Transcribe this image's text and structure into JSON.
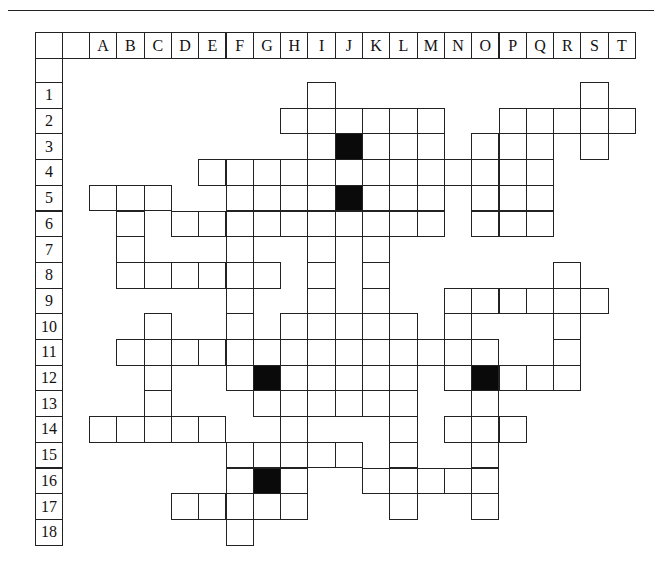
{
  "page": {
    "header_rule": true
  },
  "grid": {
    "columns": [
      "A",
      "B",
      "C",
      "D",
      "E",
      "F",
      "G",
      "H",
      "I",
      "J",
      "K",
      "L",
      "M",
      "N",
      "O",
      "P",
      "Q",
      "R",
      "S",
      "T"
    ],
    "rows": [
      "1",
      "2",
      "3",
      "4",
      "5",
      "6",
      "7",
      "8",
      "9",
      "10",
      "11",
      "12",
      "13",
      "14",
      "15",
      "16",
      "17",
      "18"
    ],
    "white_cells": {
      "1": [
        "I",
        "S"
      ],
      "2": [
        "H",
        "I",
        "J",
        "K",
        "L",
        "M",
        "P",
        "Q",
        "R",
        "S",
        "T"
      ],
      "3": [
        "I",
        "K",
        "L",
        "M",
        "O",
        "P",
        "Q",
        "S"
      ],
      "4": [
        "E",
        "F",
        "G",
        "H",
        "I",
        "J",
        "K",
        "L",
        "M",
        "N",
        "O",
        "P",
        "Q"
      ],
      "5": [
        "A",
        "B",
        "C",
        "F",
        "G",
        "H",
        "I",
        "K",
        "L",
        "M",
        "O",
        "P",
        "Q"
      ],
      "6": [
        "B",
        "D",
        "E",
        "F",
        "G",
        "H",
        "I",
        "J",
        "K",
        "L",
        "M",
        "O",
        "P",
        "Q"
      ],
      "7": [
        "B",
        "F",
        "I",
        "K"
      ],
      "8": [
        "B",
        "C",
        "D",
        "E",
        "F",
        "G",
        "I",
        "K",
        "R"
      ],
      "9": [
        "F",
        "I",
        "K",
        "N",
        "O",
        "P",
        "Q",
        "R",
        "S"
      ],
      "10": [
        "C",
        "F",
        "H",
        "I",
        "J",
        "K",
        "L",
        "N",
        "R"
      ],
      "11": [
        "B",
        "C",
        "D",
        "E",
        "F",
        "G",
        "H",
        "I",
        "J",
        "K",
        "L",
        "M",
        "N",
        "O",
        "R"
      ],
      "12": [
        "C",
        "F",
        "H",
        "I",
        "J",
        "K",
        "L",
        "N",
        "P",
        "Q",
        "R"
      ],
      "13": [
        "C",
        "G",
        "H",
        "I",
        "J",
        "K",
        "L",
        "O"
      ],
      "14": [
        "A",
        "B",
        "C",
        "D",
        "E",
        "H",
        "L",
        "N",
        "O",
        "P"
      ],
      "15": [
        "F",
        "G",
        "H",
        "I",
        "J",
        "L",
        "O"
      ],
      "16": [
        "F",
        "H",
        "K",
        "L",
        "M",
        "N",
        "O"
      ],
      "17": [
        "D",
        "E",
        "F",
        "G",
        "H",
        "L",
        "O"
      ],
      "18": [
        "F"
      ]
    },
    "black_cells": {
      "3": [
        "J"
      ],
      "5": [
        "J"
      ],
      "12": [
        "G",
        "O"
      ],
      "16": [
        "G"
      ]
    }
  },
  "colors": {
    "line": "#222222",
    "black_square": "#0a0a0a",
    "background": "#ffffff"
  }
}
